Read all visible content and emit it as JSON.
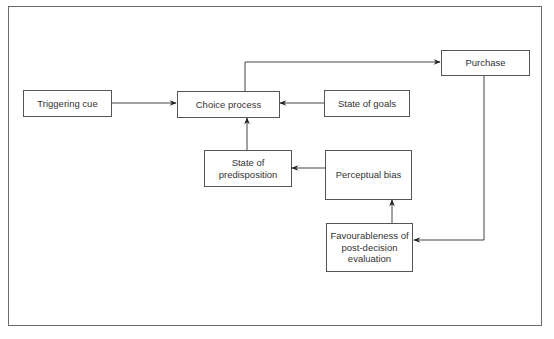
{
  "diagram": {
    "type": "flowchart",
    "colors": {
      "line": "#444444",
      "box_border": "#555555",
      "text": "#333333",
      "background": "#ffffff"
    },
    "nodes": {
      "triggering_cue": {
        "label": "Triggering cue"
      },
      "choice_process": {
        "label": "Choice process"
      },
      "purchase": {
        "label": "Purchase"
      },
      "state_of_goals": {
        "label": "State of goals"
      },
      "state_of_predisposition": {
        "label_lines": [
          "State of",
          "predisposition"
        ]
      },
      "perceptual_bias": {
        "label": "Perceptual bias"
      },
      "favourableness": {
        "label_lines": [
          "Favourableness of",
          "post-decision",
          "evaluation"
        ]
      }
    },
    "edges": [
      {
        "from": "Triggering cue",
        "to": "Choice process"
      },
      {
        "from": "Choice process",
        "to": "Purchase"
      },
      {
        "from": "State of goals",
        "to": "Choice process"
      },
      {
        "from": "State of predisposition",
        "to": "Choice process"
      },
      {
        "from": "Perceptual bias",
        "to": "State of predisposition"
      },
      {
        "from": "Favourableness of post-decision evaluation",
        "to": "Perceptual bias"
      },
      {
        "from": "Purchase",
        "to": "Favourableness of post-decision evaluation"
      }
    ]
  }
}
